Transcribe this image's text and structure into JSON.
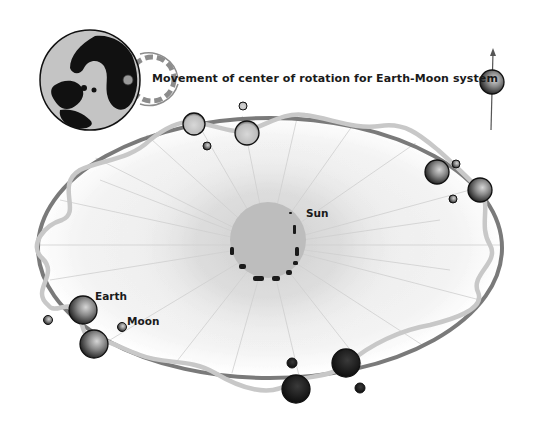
{
  "diagram": {
    "caption": "Movement of center of rotation for Earth-Moon system",
    "labels": {
      "sun": "Sun",
      "earth": "Earth",
      "moon": "Moon"
    },
    "elements": [
      {
        "name": "earth-globe-inset",
        "description": "Globe of Earth with dashed circles showing barycenter movement"
      },
      {
        "name": "barycenter-symbol",
        "description": "Small sphere on vertical arrow, upper right"
      },
      {
        "name": "sun",
        "description": "Central gray disk with radiating corona and sunspots"
      },
      {
        "name": "orbit-ellipse",
        "description": "Dark gray elliptical orbit of the Earth-Moon barycenter"
      },
      {
        "name": "wavy-path",
        "description": "Light gray sinusoidal path traced by Earth around the ellipse"
      },
      {
        "name": "earth-positions",
        "description": "Large spheres along wavy path"
      },
      {
        "name": "moon-positions",
        "description": "Small spheres near each Earth"
      }
    ],
    "colors": {
      "orbit": "#7a7a7a",
      "wavy_path": "#c8c8c8",
      "sun_disk": "#bdbdbd",
      "corona": "#d9d9d9",
      "text": "#1a1a1a",
      "background": "#ffffff"
    }
  }
}
